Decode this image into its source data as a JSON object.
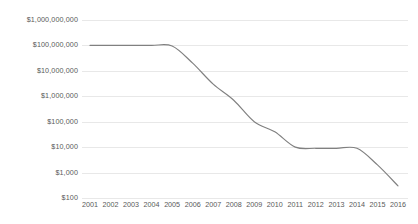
{
  "chart_data": {
    "type": "line",
    "title": "",
    "subtitle": "",
    "xlabel": "",
    "ylabel": "",
    "yscale": "log",
    "ylim": [
      100,
      1000000000
    ],
    "grid": true,
    "legend": "none",
    "line_color": "#808080",
    "grid_color": "#e8e8e8",
    "text_color": "#595959",
    "background": "#ffffff",
    "categories": [
      "2001",
      "2002",
      "2003",
      "2004",
      "2005",
      "2006",
      "2007",
      "2008",
      "2009",
      "2010",
      "2011",
      "2012",
      "2013",
      "2014",
      "2015",
      "2016"
    ],
    "x": [
      2001,
      2002,
      2003,
      2004,
      2005,
      2006,
      2007,
      2008,
      2009,
      2010,
      2011,
      2012,
      2013,
      2014,
      2015,
      2016
    ],
    "values": [
      100000000,
      100000000,
      100000000,
      100000000,
      95000000,
      20000000,
      3000000,
      700000,
      100000,
      40000,
      10000,
      9000,
      9000,
      9000,
      2000,
      300
    ],
    "ytick_labels": [
      "$1,000,000,000",
      "$100,000,000",
      "$10,000,000",
      "$1,000,000",
      "$100,000",
      "$10,000",
      "$1,000",
      "$100"
    ],
    "ytick_values": [
      1000000000,
      100000000,
      10000000,
      1000000,
      100000,
      10000,
      1000,
      100
    ],
    "xtick_labels": [
      "2001",
      "2002",
      "2003",
      "2004",
      "2005",
      "2006",
      "2007",
      "2008",
      "2009",
      "2010",
      "2011",
      "2012",
      "2013",
      "2014",
      "2015",
      "2016"
    ]
  }
}
